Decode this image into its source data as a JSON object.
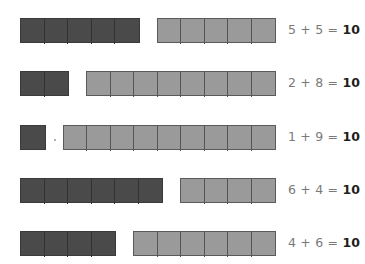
{
  "colors": {
    "dark_block": "#4a4a4a",
    "light_block": "#9a9a9a",
    "equation_text": "#7a7a7a",
    "answer_text": "#1e1e1e"
  },
  "rows": [
    {
      "dark_count": 5,
      "light_count": 5,
      "a": "5",
      "b": "5",
      "plus": "+",
      "equals": "=",
      "sum": "10"
    },
    {
      "dark_count": 2,
      "light_count": 8,
      "a": "2",
      "b": "8",
      "plus": "+",
      "equals": "=",
      "sum": "10"
    },
    {
      "dark_count": 1,
      "light_count": 9,
      "a": "1",
      "b": "9",
      "plus": "+",
      "equals": "=",
      "sum": "10"
    },
    {
      "dark_count": 6,
      "light_count": 4,
      "a": "6",
      "b": "4",
      "plus": "+",
      "equals": "=",
      "sum": "10"
    },
    {
      "dark_count": 4,
      "light_count": 6,
      "a": "4",
      "b": "6",
      "plus": "+",
      "equals": "=",
      "sum": "10"
    }
  ]
}
